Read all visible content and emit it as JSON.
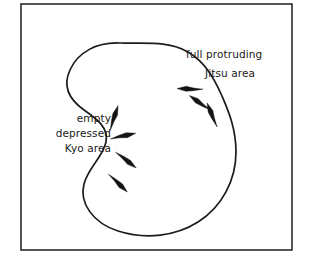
{
  "figure": {
    "background_color": "#ffffff",
    "line_color": "#1c1c1c",
    "frame": {
      "x": 21,
      "y": 4,
      "width": 271,
      "height": 246,
      "border_color": "#2b2b2b"
    }
  },
  "labels": {
    "jitsu": {
      "line1": "full protruding",
      "line2": "Jitsu area",
      "align": "left",
      "x1": 186,
      "y1": 58,
      "x2": 205,
      "y2": 77
    },
    "kyo": {
      "line1": "empty",
      "line2": "depressed",
      "line3": "Kyo area",
      "align": "right",
      "x": 111,
      "y1": 122,
      "y2": 137,
      "y3": 152
    }
  },
  "blob": {
    "description": "hand drawn closed amoeba curve with concave left waist and convex right bulge",
    "path": "M 120 43 C 97 42 78 52 70 70 C 62 87 70 100 84 110 C 97 119 109 128 106 142 C 103 157 88 168 84 184 C 79 203 93 223 118 231 C 146 240 176 236 198 222 C 222 207 236 180 236 152 C 236 128 228 110 222 96 C 214 78 205 62 188 52 C 168 40 142 44 120 43 Z"
  },
  "arrows": {
    "kyo_outward": [
      {
        "name": "kyo-arrow-1",
        "x": 114,
        "y": 118,
        "angle": -72,
        "length": 13
      },
      {
        "name": "kyo-arrow-2",
        "x": 123,
        "y": 136,
        "angle": -12,
        "length": 13
      },
      {
        "name": "kyo-arrow-3",
        "x": 126,
        "y": 160,
        "angle": 38,
        "length": 13
      },
      {
        "name": "kyo-arrow-4",
        "x": 118,
        "y": 183,
        "angle": 44,
        "length": 13
      }
    ],
    "jitsu_inward": [
      {
        "name": "jitsu-arrow-1",
        "x": 190,
        "y": 89,
        "angle": 182,
        "length": 13
      },
      {
        "name": "jitsu-arrow-2",
        "x": 200,
        "y": 103,
        "angle": 215,
        "length": 13
      },
      {
        "name": "jitsu-arrow-3",
        "x": 212,
        "y": 115,
        "angle": 248,
        "length": 13
      }
    ]
  }
}
